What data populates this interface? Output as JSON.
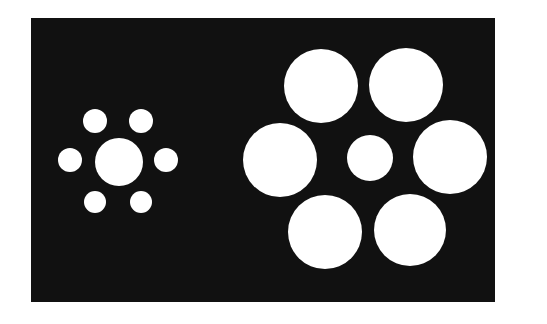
{
  "figure": {
    "page_background": "#ffffff",
    "panel": {
      "x": 31,
      "y": 18,
      "width": 464,
      "height": 284,
      "fill": "#111111"
    },
    "circle_fill": "#ffffff",
    "clusters": [
      {
        "name": "left-cluster-small-surround",
        "center": {
          "cx": 119,
          "cy": 162,
          "r": 24
        },
        "surround": [
          {
            "cx": 95,
            "cy": 121,
            "r": 12
          },
          {
            "cx": 141,
            "cy": 121,
            "r": 12
          },
          {
            "cx": 70,
            "cy": 160,
            "r": 12
          },
          {
            "cx": 166,
            "cy": 160,
            "r": 12
          },
          {
            "cx": 95,
            "cy": 202,
            "r": 11
          },
          {
            "cx": 141,
            "cy": 202,
            "r": 11
          }
        ]
      },
      {
        "name": "right-cluster-large-surround",
        "center": {
          "cx": 370,
          "cy": 158,
          "r": 23
        },
        "surround": [
          {
            "cx": 321,
            "cy": 86,
            "r": 37
          },
          {
            "cx": 406,
            "cy": 85,
            "r": 37
          },
          {
            "cx": 280,
            "cy": 160,
            "r": 37
          },
          {
            "cx": 450,
            "cy": 157,
            "r": 37
          },
          {
            "cx": 325,
            "cy": 232,
            "r": 37
          },
          {
            "cx": 410,
            "cy": 230,
            "r": 36
          }
        ]
      }
    ]
  }
}
